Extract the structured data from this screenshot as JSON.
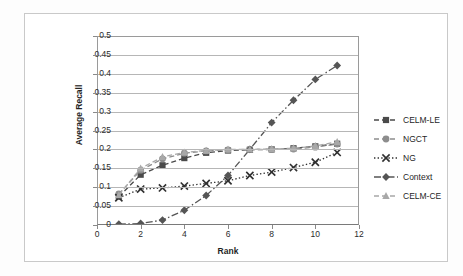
{
  "chart_data": {
    "type": "line",
    "title": "",
    "xlabel": "Rank",
    "ylabel": "Average Recall",
    "xlim": [
      0,
      12
    ],
    "ylim": [
      0,
      0.5
    ],
    "xticks": [
      0,
      2,
      4,
      6,
      8,
      10,
      12
    ],
    "yticks": [
      0,
      0.05,
      0.1,
      0.15,
      0.2,
      0.25,
      0.3,
      0.35,
      0.4,
      0.45,
      0.5
    ],
    "ytick_labels": [
      "0",
      "0.05",
      "0.1",
      "0.15",
      "0.2",
      "0.25",
      "0.3",
      "0.35",
      "0.4",
      "0.45",
      "0.5"
    ],
    "xtick_labels": [
      "0",
      "2",
      "4",
      "6",
      "8",
      "10",
      "12"
    ],
    "grid": "horizontal",
    "legend_position": "right",
    "x": [
      1,
      2,
      3,
      4,
      5,
      6,
      7,
      8,
      9,
      10,
      11
    ],
    "series": [
      {
        "name": "CELM-LE",
        "marker": "square",
        "linestyle": "dashed",
        "color": "#4a4a4a",
        "values": [
          0.075,
          0.133,
          0.158,
          0.177,
          0.191,
          0.197,
          0.199,
          0.2,
          0.203,
          0.208,
          0.215
        ]
      },
      {
        "name": "NGCT",
        "marker": "circle",
        "linestyle": "dashed",
        "color": "#8d8d8d",
        "values": [
          0.082,
          0.145,
          0.175,
          0.19,
          0.196,
          0.199,
          0.2,
          0.2,
          0.201,
          0.206,
          0.214
        ]
      },
      {
        "name": "NG",
        "marker": "cross",
        "linestyle": "dotted",
        "color": "#2f2f2f",
        "values": [
          0.072,
          0.095,
          0.098,
          0.103,
          0.11,
          0.117,
          0.131,
          0.14,
          0.152,
          0.166,
          0.192
        ]
      },
      {
        "name": "Context",
        "marker": "diamond",
        "linestyle": "dashdot",
        "color": "#555555",
        "values": [
          0.002,
          0.004,
          0.013,
          0.039,
          0.078,
          0.131,
          0.2,
          0.271,
          0.33,
          0.385,
          0.422
        ]
      },
      {
        "name": "CELM-CE",
        "marker": "triangle",
        "linestyle": "dashed",
        "color": "#a8a8a8",
        "values": [
          0.079,
          0.15,
          0.18,
          0.192,
          0.197,
          0.2,
          0.2,
          0.201,
          0.203,
          0.209,
          0.22
        ]
      }
    ]
  }
}
